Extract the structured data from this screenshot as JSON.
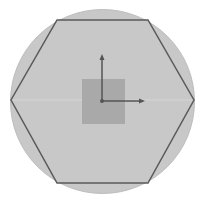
{
  "scene": {
    "background": "#ffffff",
    "circle": {
      "cx": 102.5,
      "cy": 101.5,
      "r": 92,
      "fill": "#c8c8c8",
      "stroke": "#bdbdbd"
    },
    "hexagon": {
      "points": "57,20 148,20 194,100 148,183 57,183 11,100",
      "stroke": "#5a5a5a"
    },
    "square": {
      "x": 82,
      "y": 79,
      "width": 43,
      "height": 45,
      "fill": "#a9a9a9"
    },
    "axes": {
      "origin": {
        "x": 102,
        "y": 101
      },
      "y_end": {
        "x": 102,
        "y": 54
      },
      "x_end": {
        "x": 145,
        "y": 101
      },
      "color": "#555555"
    }
  }
}
